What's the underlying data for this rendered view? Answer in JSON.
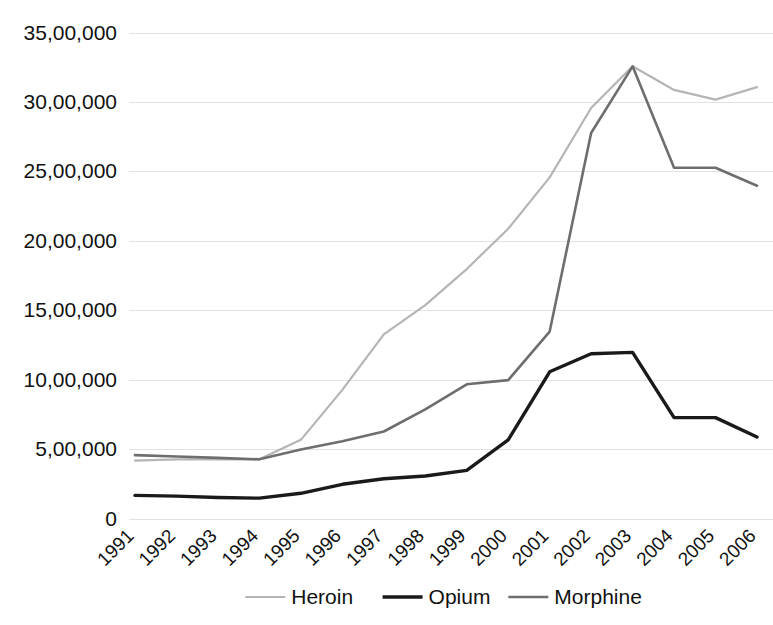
{
  "chart_data": {
    "type": "line",
    "title": "",
    "subtitle": "",
    "xlabel": "",
    "ylabel": "",
    "categories": [
      "1991",
      "1992",
      "1993",
      "1994",
      "1995",
      "1996",
      "1997",
      "1998",
      "1999",
      "2000",
      "2001",
      "2002",
      "2003",
      "2004",
      "2005",
      "2006"
    ],
    "ylim": [
      0,
      3500000
    ],
    "ytick_values": [
      0,
      500000,
      1000000,
      1500000,
      2000000,
      2500000,
      3000000,
      3500000
    ],
    "ytick_labels": [
      "0",
      "5,00,000",
      "10,00,000",
      "15,00,000",
      "20,00,000",
      "25,00,000",
      "30,00,000",
      "35,00,000"
    ],
    "grid": true,
    "grid_axis": "y",
    "legend_position": "bottom",
    "xtick_rotation": 45,
    "series": [
      {
        "name": "Heroin",
        "color": "#b5b5b5",
        "width": 2.2,
        "values": [
          420000,
          430000,
          430000,
          430000,
          570000,
          930000,
          1330000,
          1540000,
          1800000,
          2090000,
          2460000,
          2960000,
          3260000,
          3090000,
          3020000,
          3110000
        ]
      },
      {
        "name": "Opium",
        "color": "#1a1a1a",
        "width": 3.4,
        "values": [
          170000,
          165000,
          155000,
          150000,
          185000,
          250000,
          290000,
          310000,
          350000,
          570000,
          1060000,
          1190000,
          1200000,
          730000,
          730000,
          590000
        ]
      },
      {
        "name": "Morphine",
        "color": "#6e6e6e",
        "width": 2.6,
        "values": [
          460000,
          450000,
          440000,
          430000,
          500000,
          560000,
          630000,
          790000,
          970000,
          1000000,
          1350000,
          2780000,
          3260000,
          2530000,
          2530000,
          2400000
        ]
      }
    ]
  },
  "legend": {
    "items": [
      {
        "label": "Heroin"
      },
      {
        "label": "Opium"
      },
      {
        "label": "Morphine"
      }
    ]
  },
  "axes": {
    "y_labels": [
      "35,00,000",
      "30,00,000",
      "25,00,000",
      "20,00,000",
      "15,00,000",
      "10,00,000",
      "5,00,000",
      "0"
    ],
    "x_labels": [
      "1991",
      "1992",
      "1993",
      "1994",
      "1995",
      "1996",
      "1997",
      "1998",
      "1999",
      "2000",
      "2001",
      "2002",
      "2003",
      "2004",
      "2005",
      "2006"
    ]
  },
  "colors": {
    "heroin": "#b5b5b5",
    "opium": "#1a1a1a",
    "morphine": "#6e6e6e",
    "grid": "#e2e2e2",
    "text": "#111111",
    "background": "#ffffff"
  }
}
